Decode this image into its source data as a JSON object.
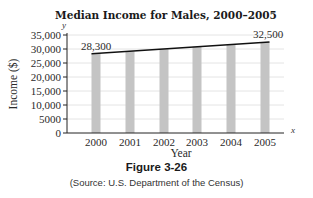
{
  "chart_data": {
    "type": "bar",
    "title": "Median Income for Males, 2000–2005",
    "xlabel": "Year",
    "ylabel": "Income ($)",
    "x_axis_var": "x",
    "y_axis_var": "y",
    "categories": [
      "2000",
      "2001",
      "2002",
      "2003",
      "2004",
      "2005"
    ],
    "values": [
      28300,
      29140,
      29980,
      30820,
      31660,
      32500
    ],
    "trend_line": {
      "type": "line",
      "start": {
        "x": "2000",
        "y": 28300
      },
      "end": {
        "x": "2005",
        "y": 32500
      }
    },
    "annotations": [
      {
        "x": "2000",
        "y": 28300,
        "text": "28,300"
      },
      {
        "x": "2005",
        "y": 32500,
        "text": "32,500"
      }
    ],
    "yticks": [
      0,
      5000,
      10000,
      15000,
      20000,
      25000,
      30000,
      35000
    ],
    "ytick_labels": [
      "0",
      "5000",
      "10,000",
      "15,000",
      "20,000",
      "25,000",
      "30,000",
      "35,000"
    ],
    "ylim": [
      0,
      35000
    ],
    "grid": true,
    "bar_color": "#c4c4c4",
    "line_color": "#111111"
  },
  "figure": {
    "number": "Figure 3-26",
    "source": "(Source: U.S. Department of the Census)"
  }
}
